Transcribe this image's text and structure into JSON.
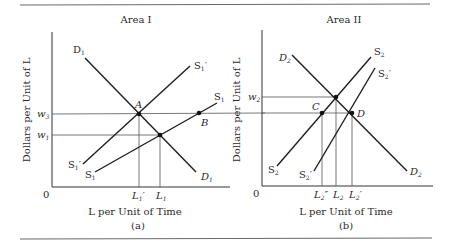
{
  "figure": {
    "rule_color": "#6a6a6a",
    "line_color": "#1e1e1e",
    "guide_color": "#555555"
  },
  "panels": [
    {
      "id": "a",
      "title": "Area I",
      "caption": "(a)",
      "x_axis_label": "L per Unit of Time",
      "y_axis_label": "Dollars per Unit of L",
      "origin_label": "0",
      "curves": [
        {
          "name": "D1",
          "label_start": "D",
          "sub": "1",
          "prime": "",
          "end_label": "D",
          "end_sub": "1"
        },
        {
          "name": "S1'",
          "label_start": "S",
          "sub": "1",
          "prime": "′",
          "end_label": "S",
          "end_sub": "1",
          "end_prime": "′"
        },
        {
          "name": "S1",
          "label_start": "S",
          "sub": "1",
          "prime": "",
          "end_label": "S",
          "end_sub": "1"
        }
      ],
      "y_ticks": [
        {
          "label": "w",
          "sub": "3"
        },
        {
          "label": "w",
          "sub": "1"
        }
      ],
      "x_ticks": [
        {
          "label": "L",
          "sub": "1",
          "prime": "′"
        },
        {
          "label": "L",
          "sub": "1",
          "prime": ""
        }
      ],
      "points": [
        {
          "label": "A"
        },
        {
          "label": "B"
        }
      ]
    },
    {
      "id": "b",
      "title": "Area II",
      "caption": "(b)",
      "x_axis_label": "L per Unit of Time",
      "y_axis_label": "Dollars per Unit of L",
      "origin_label": "0",
      "curves": [
        {
          "name": "D2",
          "label_start": "D",
          "sub": "2",
          "end_label": "D",
          "end_sub": "2"
        },
        {
          "name": "S2",
          "label_start": "S",
          "sub": "2",
          "end_label": "S",
          "end_sub": "2"
        },
        {
          "name": "S2'",
          "label_start": "S",
          "sub": "2",
          "prime": "′",
          "end_label": "S",
          "end_sub": "2",
          "end_prime": "′"
        }
      ],
      "y_ticks": [
        {
          "label": "w",
          "sub": "2"
        }
      ],
      "x_ticks": [
        {
          "label": "L",
          "sub": "2",
          "prime": "″"
        },
        {
          "label": "L",
          "sub": "2",
          "prime": ""
        },
        {
          "label": "L",
          "sub": "2",
          "prime": "′"
        }
      ],
      "points": [
        {
          "label": "C"
        },
        {
          "label": "D"
        }
      ]
    }
  ]
}
